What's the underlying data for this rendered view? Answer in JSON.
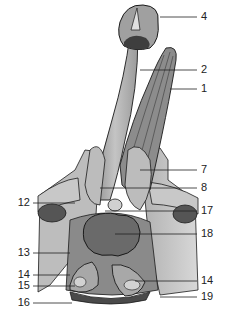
{
  "figure": {
    "colors": {
      "background": "#ffffff",
      "outline": "#1a1a1a",
      "light_tissue": "#c8c8c8",
      "mid_tissue": "#9a9a9a",
      "dark_tissue": "#6e6e6e",
      "darkest": "#4a4a4a",
      "leader_line": "#222222"
    }
  },
  "labels": {
    "right": [
      {
        "id": "4",
        "text": "4",
        "y": 17
      },
      {
        "id": "2",
        "text": "2",
        "y": 70
      },
      {
        "id": "1",
        "text": "1",
        "y": 89
      },
      {
        "id": "7",
        "text": "7",
        "y": 170
      },
      {
        "id": "8",
        "text": "8",
        "y": 188
      },
      {
        "id": "17",
        "text": "17",
        "y": 211
      },
      {
        "id": "18",
        "text": "18",
        "y": 234
      },
      {
        "id": "14r",
        "text": "14",
        "y": 281
      },
      {
        "id": "19",
        "text": "19",
        "y": 297
      }
    ],
    "left": [
      {
        "id": "12",
        "text": "12",
        "y": 203
      },
      {
        "id": "13",
        "text": "13",
        "y": 253
      },
      {
        "id": "14l",
        "text": "14",
        "y": 275
      },
      {
        "id": "15",
        "text": "15",
        "y": 286
      },
      {
        "id": "16",
        "text": "16",
        "y": 303
      }
    ]
  }
}
